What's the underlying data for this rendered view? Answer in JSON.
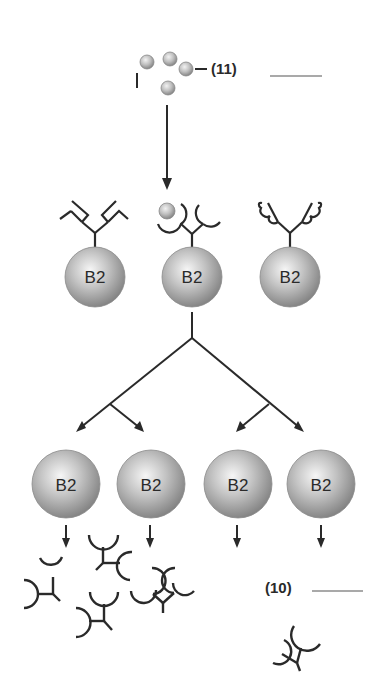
{
  "diagram": {
    "type": "clonal-selection",
    "labels": {
      "antigen_label": "(11)",
      "antigen_blank": "",
      "antibody_label": "(10)",
      "antibody_blank": ""
    },
    "top_cells": [
      {
        "label": "B2",
        "receptor": "angular"
      },
      {
        "label": "B2",
        "receptor": "rounded-bound"
      },
      {
        "label": "B2",
        "receptor": "wavy"
      }
    ],
    "bottom_cells": [
      {
        "label": "B2"
      },
      {
        "label": "B2"
      },
      {
        "label": "B2"
      },
      {
        "label": "B2"
      }
    ],
    "colors": {
      "line": "#2a2a2a",
      "sphere_light": "#f4f4f4",
      "sphere_mid": "#b8b8b8",
      "sphere_dark": "#7a7a7a"
    }
  }
}
